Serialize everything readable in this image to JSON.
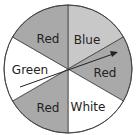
{
  "spinner": {
    "sections": [
      {
        "label": "Blue",
        "color": "#c8c8c8"
      },
      {
        "label": "Red",
        "color": "#a9a9a9"
      },
      {
        "label": "White",
        "color": "#ffffff"
      },
      {
        "label": "Red",
        "color": "#a9a9a9"
      },
      {
        "label": "Green",
        "color": "#ffffff"
      },
      {
        "label": "Red",
        "color": "#a9a9a9"
      }
    ],
    "arrow": "pointer-arrow"
  }
}
